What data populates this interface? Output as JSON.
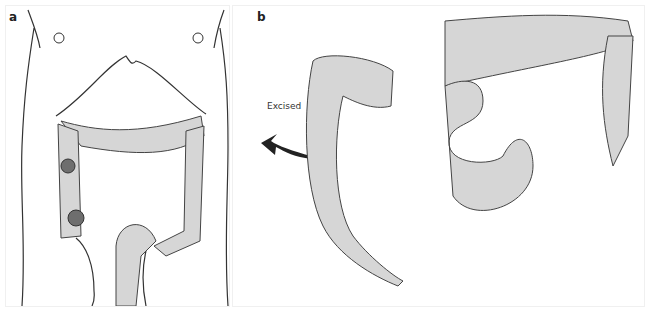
{
  "figure": {
    "panels": [
      {
        "label": "a",
        "description": "Anterior abdomen with colon showing two lesions in ascending colon"
      },
      {
        "label": "b",
        "description": "Excised colon segment and remaining bowel anastomosis"
      }
    ],
    "annotations": {
      "excised_label": "Excised"
    },
    "colors": {
      "bowel_fill": "#d6d6d6",
      "outline": "#333333",
      "lesion_fill": "#6e6e6e",
      "background": "#ffffff"
    }
  }
}
